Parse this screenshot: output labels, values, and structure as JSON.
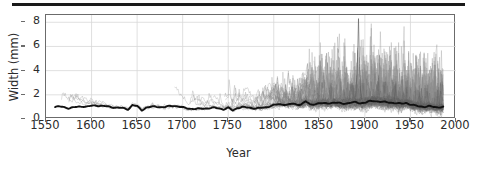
{
  "chart_data": {
    "type": "line",
    "title": "",
    "xlabel": "Year",
    "ylabel": "Width (mm)",
    "xlim": [
      1550,
      2000
    ],
    "ylim": [
      0,
      8.6
    ],
    "xticks": [
      1550,
      1600,
      1650,
      1700,
      1750,
      1800,
      1850,
      1900,
      1950,
      2000
    ],
    "yticks": [
      0,
      2,
      4,
      6,
      8
    ],
    "grid": true,
    "legend": "none",
    "data_span": [
      1560,
      1986
    ],
    "colors": {
      "series": "#8a8a8a",
      "mean": "#111111",
      "frame": "#6b6b6b",
      "grid": "#d8d8d8",
      "text": "#2b2b2b",
      "rule": "#1a1a1a"
    },
    "mean_series": {
      "name": "Mean ring width",
      "x": [
        1560,
        1565,
        1570,
        1575,
        1580,
        1585,
        1590,
        1595,
        1600,
        1605,
        1610,
        1615,
        1620,
        1625,
        1630,
        1635,
        1640,
        1645,
        1650,
        1655,
        1660,
        1665,
        1670,
        1675,
        1680,
        1685,
        1690,
        1695,
        1700,
        1705,
        1710,
        1715,
        1720,
        1725,
        1730,
        1735,
        1740,
        1745,
        1750,
        1755,
        1760,
        1765,
        1770,
        1775,
        1780,
        1785,
        1790,
        1795,
        1800,
        1805,
        1810,
        1815,
        1820,
        1825,
        1830,
        1835,
        1840,
        1845,
        1850,
        1855,
        1860,
        1865,
        1870,
        1875,
        1880,
        1885,
        1890,
        1895,
        1900,
        1905,
        1910,
        1915,
        1920,
        1925,
        1930,
        1935,
        1940,
        1945,
        1950,
        1955,
        1960,
        1965,
        1970,
        1975,
        1980,
        1986
      ],
      "y": [
        1.0,
        1.02,
        0.98,
        0.9,
        0.95,
        1.0,
        1.05,
        1.02,
        1.08,
        1.12,
        1.1,
        1.05,
        1.0,
        0.96,
        0.92,
        0.88,
        0.8,
        1.15,
        1.05,
        0.72,
        0.95,
        1.0,
        1.02,
        1.0,
        0.98,
        1.05,
        1.1,
        1.05,
        0.95,
        0.88,
        0.85,
        0.83,
        0.85,
        0.88,
        0.9,
        0.92,
        0.88,
        0.8,
        0.92,
        0.7,
        0.92,
        0.98,
        0.95,
        0.92,
        0.88,
        0.9,
        0.95,
        1.05,
        1.15,
        1.2,
        1.22,
        1.18,
        1.25,
        1.2,
        1.22,
        1.45,
        1.18,
        1.25,
        1.3,
        1.28,
        1.32,
        1.35,
        1.32,
        1.28,
        1.3,
        1.35,
        1.38,
        1.32,
        1.35,
        1.45,
        1.5,
        1.45,
        1.4,
        1.38,
        1.35,
        1.3,
        1.25,
        1.35,
        1.2,
        1.1,
        1.05,
        1.02,
        1.05,
        1.0,
        0.98,
        1.0
      ]
    },
    "series_count_note": "sample depth increases sharply after 1800",
    "max_observed_value": 8.3,
    "max_observed_year": 1893
  }
}
